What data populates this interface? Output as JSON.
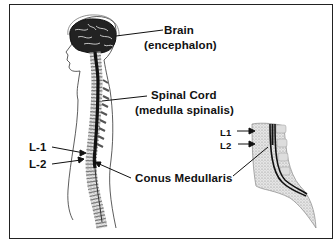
{
  "figure": {
    "labels": {
      "brain": "Brain",
      "brain_latin": "(encephalon)",
      "spinal_cord": "Spinal Cord",
      "spinal_cord_latin": "(medulla spinalis)",
      "l1_body": "L-1",
      "l2_body": "L-2",
      "conus": "Conus Medullaris",
      "l1_detail": "L1",
      "l2_detail": "L2"
    },
    "colors": {
      "ink": "#111111",
      "border": "#222222",
      "background": "#ffffff",
      "bone_stipple": "#9a9a9a"
    }
  }
}
